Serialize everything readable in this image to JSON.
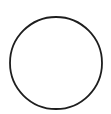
{
  "shape": {
    "type": "circle",
    "cx": 56,
    "cy": 63,
    "r": 46,
    "stroke_color": "#1e1e1e",
    "stroke_width": 1.8,
    "fill": "#ffffff"
  },
  "background_color": "#ffffff"
}
